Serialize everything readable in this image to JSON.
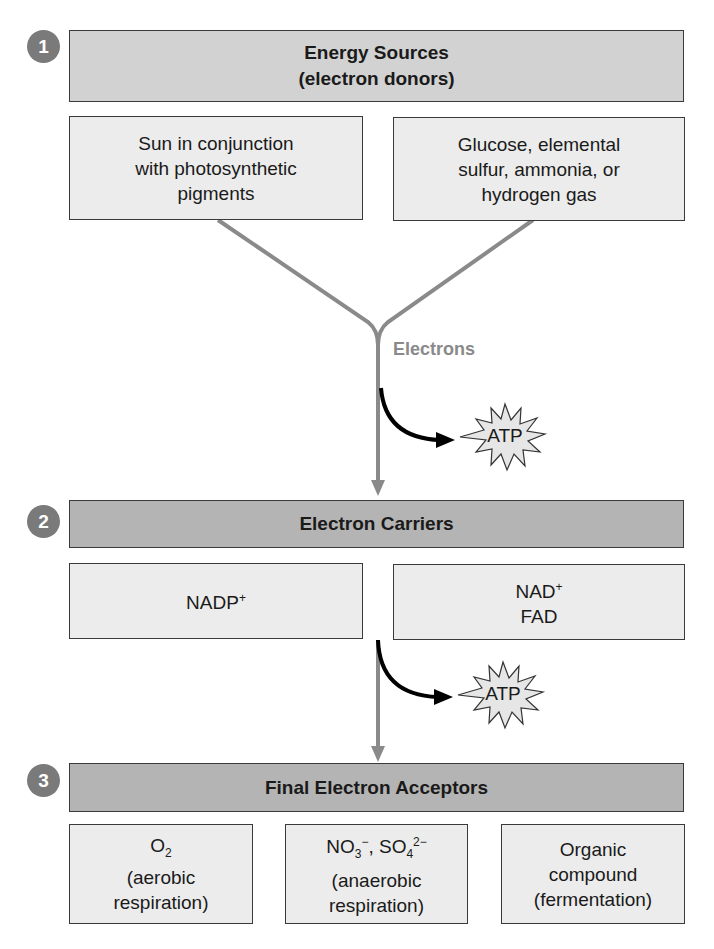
{
  "sections": [
    {
      "number": "1",
      "title_line1": "Energy Sources",
      "title_line2": "(electron donors)",
      "boxes": [
        {
          "lines": [
            "Sun in conjunction",
            "with photosynthetic",
            "pigments"
          ]
        },
        {
          "lines": [
            "Glucose, elemental",
            "sulfur, ammonia, or",
            "hydrogen gas"
          ]
        }
      ]
    },
    {
      "number": "2",
      "title": "Electron Carriers",
      "boxes": [
        {
          "lines": [
            "NADP+"
          ]
        },
        {
          "lines": [
            "NAD+",
            "FAD"
          ]
        }
      ]
    },
    {
      "number": "3",
      "title": "Final Electron Acceptors",
      "boxes": [
        {
          "lines": [
            "O2",
            "(aerobic",
            "respiration)"
          ]
        },
        {
          "lines": [
            "NO3−, SO4 2−",
            "(anaerobic",
            "respiration)"
          ]
        },
        {
          "lines": [
            "Organic",
            "compound",
            "(fermentation)"
          ]
        }
      ]
    }
  ],
  "flow_label": "Electrons",
  "atp_label_1": "ATP",
  "atp_label_2": "ATP",
  "chem": {
    "nadp": "NADP",
    "nad": "NAD",
    "plus": "+",
    "fad": "FAD",
    "o": "O",
    "two": "2",
    "no": "NO",
    "three": "3",
    "minus": "−",
    "comma": ", ",
    "so": "SO",
    "four": "4",
    "twominus": "2−"
  },
  "colors": {
    "badge": "#7a7a7a",
    "header_light": "#d2d2d2",
    "header_dark": "#b4b4b4",
    "box_fill": "#ececec",
    "electron_line": "#8a8a8a",
    "atp_arrow": "#000000"
  }
}
